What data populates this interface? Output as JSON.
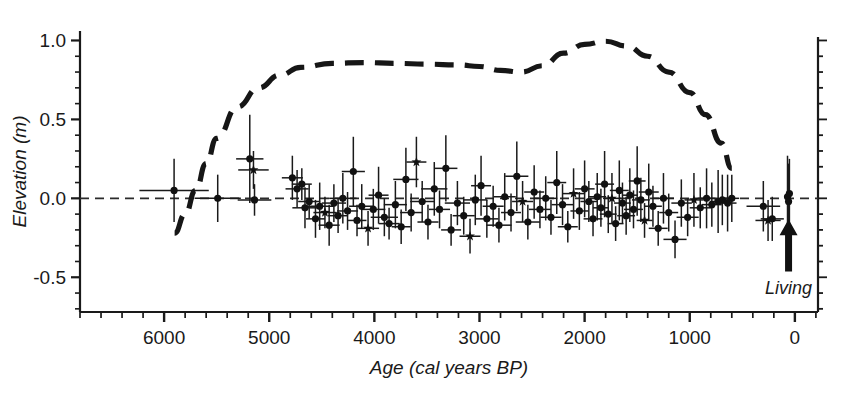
{
  "chart_data": {
    "type": "scatter",
    "title": "",
    "xlabel": "Age (cal years BP)",
    "ylabel": "Elevation (m)",
    "xlim": [
      6800,
      -220
    ],
    "ylim": [
      -0.72,
      1.06
    ],
    "x_ticks_major": [
      6000,
      5000,
      4000,
      3000,
      2000,
      1000,
      0
    ],
    "x_tick_labels": [
      "6000",
      "5000",
      "4000",
      "3000",
      "2000",
      "1000",
      "0"
    ],
    "x_minor_step": 200,
    "y_ticks_major": [
      1.0,
      0.5,
      0.0,
      -0.5
    ],
    "y_tick_labels": [
      "1.0",
      "0.5",
      "0.0",
      "-0.5"
    ],
    "y_minor_step": 0.1,
    "grid": false,
    "legend_position": "none",
    "zero_line": {
      "y": 0.0,
      "style": "dashed",
      "label": "sea-level datum"
    },
    "annotations": [
      {
        "text": "Living",
        "x": 60,
        "y": -0.45,
        "arrow_to_x": 60,
        "arrow_to_y": -0.17
      }
    ],
    "series": [
      {
        "name": "Sea-level index points",
        "marker": "circle",
        "style": "points-with-xy-error-bars",
        "points": [
          {
            "x": 5905,
            "y": 0.05,
            "xerr": 330,
            "yerr": 0.2
          },
          {
            "x": 5490,
            "y": 0.0,
            "xerr": 220,
            "yerr": 0.15
          },
          {
            "x": 5185,
            "y": 0.25,
            "xerr": 130,
            "yerr": 0.28
          },
          {
            "x": 5150,
            "y": 0.18,
            "xerr": 145,
            "yerr": 0.12
          },
          {
            "x": 5140,
            "y": -0.01,
            "xerr": 160,
            "yerr": 0.1
          },
          {
            "x": 4780,
            "y": 0.13,
            "xerr": 100,
            "yerr": 0.14
          },
          {
            "x": 4735,
            "y": 0.06,
            "xerr": 110,
            "yerr": 0.12
          },
          {
            "x": 4690,
            "y": 0.09,
            "xerr": 95,
            "yerr": 0.1
          },
          {
            "x": 4660,
            "y": -0.06,
            "xerr": 120,
            "yerr": 0.13
          },
          {
            "x": 4620,
            "y": -0.02,
            "xerr": 105,
            "yerr": 0.11
          },
          {
            "x": 4560,
            "y": -0.13,
            "xerr": 90,
            "yerr": 0.12
          },
          {
            "x": 4520,
            "y": -0.05,
            "xerr": 130,
            "yerr": 0.15
          },
          {
            "x": 4470,
            "y": -0.09,
            "xerr": 110,
            "yerr": 0.1
          },
          {
            "x": 4430,
            "y": -0.17,
            "xerr": 100,
            "yerr": 0.13
          },
          {
            "x": 4385,
            "y": -0.03,
            "xerr": 115,
            "yerr": 0.12
          },
          {
            "x": 4345,
            "y": -0.11,
            "xerr": 95,
            "yerr": 0.11
          },
          {
            "x": 4300,
            "y": 0.0,
            "xerr": 130,
            "yerr": 0.16
          },
          {
            "x": 4255,
            "y": -0.08,
            "xerr": 100,
            "yerr": 0.12
          },
          {
            "x": 4200,
            "y": 0.17,
            "xerr": 110,
            "yerr": 0.22
          },
          {
            "x": 4165,
            "y": -0.14,
            "xerr": 90,
            "yerr": 0.1
          },
          {
            "x": 4120,
            "y": -0.05,
            "xerr": 120,
            "yerr": 0.14
          },
          {
            "x": 4060,
            "y": -0.19,
            "xerr": 105,
            "yerr": 0.11
          },
          {
            "x": 4010,
            "y": -0.07,
            "xerr": 115,
            "yerr": 0.13
          },
          {
            "x": 3960,
            "y": 0.02,
            "xerr": 95,
            "yerr": 0.18
          },
          {
            "x": 3905,
            "y": -0.12,
            "xerr": 130,
            "yerr": 0.12
          },
          {
            "x": 3860,
            "y": -0.16,
            "xerr": 100,
            "yerr": 0.1
          },
          {
            "x": 3800,
            "y": -0.04,
            "xerr": 110,
            "yerr": 0.15
          },
          {
            "x": 3745,
            "y": -0.18,
            "xerr": 90,
            "yerr": 0.11
          },
          {
            "x": 3700,
            "y": 0.12,
            "xerr": 120,
            "yerr": 0.2
          },
          {
            "x": 3650,
            "y": -0.09,
            "xerr": 105,
            "yerr": 0.12
          },
          {
            "x": 3600,
            "y": 0.23,
            "xerr": 95,
            "yerr": 0.16
          },
          {
            "x": 3545,
            "y": -0.02,
            "xerr": 115,
            "yerr": 0.13
          },
          {
            "x": 3490,
            "y": -0.15,
            "xerr": 100,
            "yerr": 0.11
          },
          {
            "x": 3430,
            "y": 0.06,
            "xerr": 125,
            "yerr": 0.17
          },
          {
            "x": 3380,
            "y": -0.07,
            "xerr": 100,
            "yerr": 0.12
          },
          {
            "x": 3320,
            "y": 0.19,
            "xerr": 110,
            "yerr": 0.21
          },
          {
            "x": 3270,
            "y": -0.2,
            "xerr": 95,
            "yerr": 0.1
          },
          {
            "x": 3210,
            "y": -0.03,
            "xerr": 120,
            "yerr": 0.14
          },
          {
            "x": 3150,
            "y": -0.11,
            "xerr": 105,
            "yerr": 0.12
          },
          {
            "x": 3090,
            "y": -0.24,
            "xerr": 100,
            "yerr": 0.11
          },
          {
            "x": 3040,
            "y": -0.01,
            "xerr": 115,
            "yerr": 0.16
          },
          {
            "x": 2985,
            "y": 0.08,
            "xerr": 95,
            "yerr": 0.19
          },
          {
            "x": 2930,
            "y": -0.13,
            "xerr": 110,
            "yerr": 0.12
          },
          {
            "x": 2870,
            "y": -0.05,
            "xerr": 100,
            "yerr": 0.13
          },
          {
            "x": 2815,
            "y": -0.17,
            "xerr": 120,
            "yerr": 0.11
          },
          {
            "x": 2760,
            "y": 0.01,
            "xerr": 105,
            "yerr": 0.15
          },
          {
            "x": 2700,
            "y": -0.09,
            "xerr": 95,
            "yerr": 0.12
          },
          {
            "x": 2645,
            "y": 0.14,
            "xerr": 110,
            "yerr": 0.22
          },
          {
            "x": 2590,
            "y": -0.02,
            "xerr": 100,
            "yerr": 0.13
          },
          {
            "x": 2540,
            "y": -0.15,
            "xerr": 115,
            "yerr": 0.11
          },
          {
            "x": 2480,
            "y": 0.04,
            "xerr": 95,
            "yerr": 0.17
          },
          {
            "x": 2425,
            "y": -0.07,
            "xerr": 105,
            "yerr": 0.12
          },
          {
            "x": 2370,
            "y": 0.0,
            "xerr": 110,
            "yerr": 0.14
          },
          {
            "x": 2320,
            "y": -0.12,
            "xerr": 100,
            "yerr": 0.11
          },
          {
            "x": 2265,
            "y": 0.1,
            "xerr": 90,
            "yerr": 0.2
          },
          {
            "x": 2210,
            "y": -0.04,
            "xerr": 105,
            "yerr": 0.13
          },
          {
            "x": 2160,
            "y": -0.18,
            "xerr": 95,
            "yerr": 0.1
          },
          {
            "x": 2105,
            "y": 0.03,
            "xerr": 110,
            "yerr": 0.16
          },
          {
            "x": 2050,
            "y": -0.08,
            "xerr": 85,
            "yerr": 0.12
          },
          {
            "x": 2000,
            "y": 0.06,
            "xerr": 95,
            "yerr": 0.18
          },
          {
            "x": 1960,
            "y": -0.02,
            "xerr": 80,
            "yerr": 0.13
          },
          {
            "x": 1920,
            "y": -0.13,
            "xerr": 90,
            "yerr": 0.11
          },
          {
            "x": 1880,
            "y": 0.01,
            "xerr": 85,
            "yerr": 0.15
          },
          {
            "x": 1845,
            "y": -0.06,
            "xerr": 75,
            "yerr": 0.12
          },
          {
            "x": 1810,
            "y": 0.09,
            "xerr": 90,
            "yerr": 0.21
          },
          {
            "x": 1775,
            "y": -0.1,
            "xerr": 80,
            "yerr": 0.12
          },
          {
            "x": 1740,
            "y": 0.0,
            "xerr": 85,
            "yerr": 0.16
          },
          {
            "x": 1705,
            "y": -0.16,
            "xerr": 75,
            "yerr": 0.11
          },
          {
            "x": 1670,
            "y": 0.05,
            "xerr": 90,
            "yerr": 0.19
          },
          {
            "x": 1640,
            "y": -0.03,
            "xerr": 80,
            "yerr": 0.13
          },
          {
            "x": 1605,
            "y": -0.11,
            "xerr": 85,
            "yerr": 0.12
          },
          {
            "x": 1570,
            "y": 0.02,
            "xerr": 75,
            "yerr": 0.17
          },
          {
            "x": 1535,
            "y": -0.07,
            "xerr": 90,
            "yerr": 0.12
          },
          {
            "x": 1500,
            "y": 0.11,
            "xerr": 80,
            "yerr": 0.22
          },
          {
            "x": 1465,
            "y": -0.01,
            "xerr": 85,
            "yerr": 0.14
          },
          {
            "x": 1430,
            "y": -0.14,
            "xerr": 75,
            "yerr": 0.11
          },
          {
            "x": 1390,
            "y": 0.04,
            "xerr": 95,
            "yerr": 0.18
          },
          {
            "x": 1350,
            "y": -0.05,
            "xerr": 85,
            "yerr": 0.13
          },
          {
            "x": 1300,
            "y": -0.19,
            "xerr": 90,
            "yerr": 0.11
          },
          {
            "x": 1250,
            "y": 0.0,
            "xerr": 100,
            "yerr": 0.16
          },
          {
            "x": 1200,
            "y": -0.09,
            "xerr": 90,
            "yerr": 0.12
          },
          {
            "x": 1140,
            "y": -0.26,
            "xerr": 110,
            "yerr": 0.12
          },
          {
            "x": 1080,
            "y": -0.03,
            "xerr": 95,
            "yerr": 0.15
          },
          {
            "x": 1020,
            "y": -0.12,
            "xerr": 105,
            "yerr": 0.12
          },
          {
            "x": 960,
            "y": -0.01,
            "xerr": 90,
            "yerr": 0.17
          },
          {
            "x": 900,
            "y": -0.06,
            "xerr": 100,
            "yerr": 0.13
          },
          {
            "x": 840,
            "y": 0.0,
            "xerr": 85,
            "yerr": 0.19
          },
          {
            "x": 790,
            "y": -0.04,
            "xerr": 95,
            "yerr": 0.14
          },
          {
            "x": 730,
            "y": -0.02,
            "xerr": 80,
            "yerr": 0.2
          },
          {
            "x": 690,
            "y": -0.01,
            "xerr": 75,
            "yerr": 0.16
          },
          {
            "x": 640,
            "y": -0.03,
            "xerr": 85,
            "yerr": 0.18
          },
          {
            "x": 600,
            "y": 0.0,
            "xerr": 70,
            "yerr": 0.15
          },
          {
            "x": 300,
            "y": -0.05,
            "xerr": 160,
            "yerr": 0.16
          },
          {
            "x": 255,
            "y": -0.14,
            "xerr": 120,
            "yerr": 0.13
          },
          {
            "x": 215,
            "y": -0.13,
            "xerr": 110,
            "yerr": 0.14
          },
          {
            "x": 70,
            "y": 0.01,
            "xerr": 30,
            "yerr": 0.26
          },
          {
            "x": 60,
            "y": -0.02,
            "xerr": 25,
            "yerr": 0.24
          },
          {
            "x": 52,
            "y": 0.03,
            "xerr": 22,
            "yerr": 0.22
          }
        ]
      },
      {
        "name": "Reconstructed relative sea level (smoothed)",
        "marker": "none",
        "style": "thick-dashed-line",
        "x": [
          5900,
          5800,
          5700,
          5600,
          5500,
          5300,
          5100,
          4900,
          4700,
          4400,
          4100,
          3800,
          3500,
          3200,
          3000,
          2800,
          2600,
          2400,
          2200,
          2000,
          1800,
          1600,
          1400,
          1200,
          1000,
          850,
          700,
          600
        ],
        "y": [
          -0.22,
          -0.1,
          0.05,
          0.22,
          0.38,
          0.58,
          0.7,
          0.78,
          0.83,
          0.855,
          0.86,
          0.855,
          0.85,
          0.845,
          0.835,
          0.81,
          0.8,
          0.84,
          0.92,
          0.975,
          0.995,
          0.965,
          0.9,
          0.8,
          0.67,
          0.53,
          0.35,
          0.19
        ]
      }
    ]
  },
  "axes": {
    "y_title": "Elevation (m)",
    "x_title": "Age (cal years BP)",
    "y_labels": [
      "1.0",
      "0.5",
      "0.0",
      "-0.5"
    ],
    "x_labels": [
      "6000",
      "5000",
      "4000",
      "3000",
      "2000",
      "1000",
      "0"
    ]
  },
  "annotation": {
    "living_label": "Living"
  },
  "colors": {
    "ink": "#1a1a1a",
    "background": "#ffffff",
    "curve": "#161616",
    "datum_line": "#2b2b2b"
  }
}
